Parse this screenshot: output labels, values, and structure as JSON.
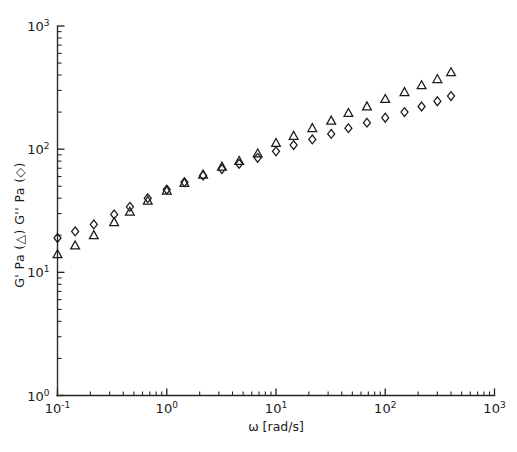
{
  "chart_data": {
    "type": "scatter",
    "title": "",
    "xlabel": "ω [rad/s]",
    "ylabel": "G' Pa (△) G'' Pa (◇)",
    "xscale": "log",
    "yscale": "log",
    "xlim": [
      0.1,
      1000
    ],
    "ylim": [
      1,
      1000
    ],
    "grid": false,
    "legend": "inline-in-axis-label",
    "xticklabels": [
      "10-1",
      "100",
      "101",
      "102",
      "103"
    ],
    "yticklabels": [
      "100",
      "101",
      "102",
      "103"
    ],
    "xtick_exponents": [
      "-1",
      "0",
      "1",
      "2",
      "3"
    ],
    "ytick_exponents": [
      "0",
      "1",
      "2",
      "3"
    ],
    "xtick_mantissa": "10",
    "ytick_mantissa": "10",
    "series": [
      {
        "name": "G'",
        "marker": "triangle",
        "symbol": "△",
        "x": [
          0.1,
          0.145,
          0.215,
          0.33,
          0.46,
          0.67,
          1.0,
          1.45,
          2.15,
          3.2,
          4.6,
          6.8,
          10.0,
          14.5,
          21.5,
          32.0,
          46.0,
          68.0,
          100.0,
          150.0,
          215.0,
          300.0,
          400.0
        ],
        "y": [
          14.0,
          16.5,
          20.0,
          25.5,
          31.0,
          38.0,
          46.0,
          53.0,
          62.0,
          72.0,
          80.0,
          92.0,
          112.0,
          128.0,
          148.0,
          170.0,
          196.0,
          222.0,
          255.0,
          290.0,
          330.0,
          370.0,
          420.0
        ]
      },
      {
        "name": "G''",
        "marker": "diamond",
        "symbol": "◇",
        "x": [
          0.1,
          0.145,
          0.215,
          0.33,
          0.46,
          0.67,
          1.0,
          1.45,
          2.15,
          3.2,
          4.6,
          6.8,
          10.0,
          14.5,
          21.5,
          32.0,
          46.0,
          68.0,
          100.0,
          150.0,
          215.0,
          300.0,
          400.0
        ],
        "y": [
          19.0,
          21.5,
          24.5,
          29.5,
          34.0,
          40.0,
          47.0,
          54.0,
          61.0,
          69.0,
          76.0,
          85.0,
          96.0,
          108.0,
          120.0,
          133.0,
          148.0,
          164.0,
          180.0,
          200.0,
          222.0,
          245.0,
          270.0
        ]
      }
    ],
    "annotations": []
  }
}
